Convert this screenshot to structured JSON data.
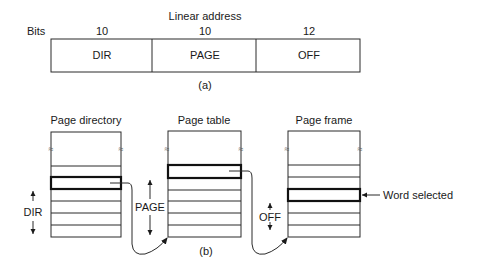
{
  "part_a": {
    "title": "Linear address",
    "bits_label": "Bits",
    "fields": [
      {
        "name": "DIR",
        "bits": "10"
      },
      {
        "name": "PAGE",
        "bits": "10"
      },
      {
        "name": "OFF",
        "bits": "12"
      }
    ],
    "caption": "(a)"
  },
  "part_b": {
    "tables": [
      {
        "title": "Page directory",
        "index_label": "DIR"
      },
      {
        "title": "Page table",
        "index_label": "PAGE"
      },
      {
        "title": "Page frame",
        "index_label": "OFF"
      }
    ],
    "selected_annotation": "Word selected",
    "break_symbol": "≈",
    "caption": "(b)"
  },
  "colors": {
    "stroke": "#2a2a2a",
    "text": "#1a1a1a",
    "background": "#ffffff"
  }
}
